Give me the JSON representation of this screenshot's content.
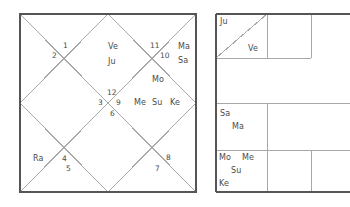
{
  "north_chart": {
    "name": "north-indian-rasi-chart",
    "style": "north-indian-diamond",
    "frame": {
      "x": 20,
      "y": 14,
      "width": 176,
      "height": 178,
      "border_color": "#555555",
      "line_color": "#a8a8a8"
    },
    "houses": [
      {
        "number": "1",
        "x": 63,
        "y": 42,
        "planets": []
      },
      {
        "number": "2",
        "x": 52,
        "y": 52,
        "planets": []
      },
      {
        "number": "3",
        "x": 98,
        "y": 99,
        "planets": []
      },
      {
        "number": "4",
        "x": 62,
        "y": 155,
        "planets": []
      },
      {
        "number": "5",
        "x": 66,
        "y": 165,
        "planets": []
      },
      {
        "number": "6",
        "x": 110,
        "y": 110,
        "planets": []
      },
      {
        "number": "7",
        "x": 155,
        "y": 165,
        "planets": []
      },
      {
        "number": "8",
        "x": 166,
        "y": 154,
        "planets": []
      },
      {
        "number": "9",
        "x": 116,
        "y": 99,
        "planets": []
      },
      {
        "number": "10",
        "x": 160,
        "y": 52,
        "planets": []
      },
      {
        "number": "11",
        "x": 150,
        "y": 42,
        "planets": []
      },
      {
        "number": "12",
        "x": 107,
        "y": 89,
        "planets": []
      }
    ],
    "planet_labels": [
      {
        "text": "Ve",
        "x": 108,
        "y": 43
      },
      {
        "text": "Ju",
        "x": 108,
        "y": 58
      },
      {
        "text": "Ma",
        "x": 178,
        "y": 43
      },
      {
        "text": "Sa",
        "x": 178,
        "y": 57
      },
      {
        "text": "Mo",
        "x": 152,
        "y": 76
      },
      {
        "text": "Me",
        "x": 134,
        "y": 99
      },
      {
        "text": "Su",
        "x": 152,
        "y": 99
      },
      {
        "text": "Ke",
        "x": 170,
        "y": 99
      },
      {
        "text": "Ra",
        "x": 33,
        "y": 155
      }
    ]
  },
  "south_chart": {
    "name": "south-indian-rasi-chart",
    "style": "south-indian-grid",
    "frame": {
      "x": 216,
      "y": 14,
      "width": 138,
      "height": 178,
      "border_color": "#555555",
      "line_color": "#a8a8a8"
    },
    "grid_lines": {
      "vertical_x": [
        267,
        311
      ],
      "horizontal_y": [
        58,
        103,
        150
      ]
    },
    "diagonal_cell": {
      "x1": 216,
      "y1": 58,
      "x2": 267,
      "y2": 14
    },
    "cells": [
      {
        "name": "cell-top-left",
        "labels": [
          {
            "text": "Ju",
            "x": 220,
            "y": 18
          },
          {
            "text": "Ve",
            "x": 248,
            "y": 45
          }
        ]
      },
      {
        "name": "cell-left-upper-mid",
        "labels": []
      },
      {
        "name": "cell-left-lower-mid",
        "labels": [
          {
            "text": "Sa",
            "x": 220,
            "y": 110
          },
          {
            "text": "Ma",
            "x": 232,
            "y": 123
          }
        ]
      },
      {
        "name": "cell-bottom-left",
        "labels": [
          {
            "text": "Mo",
            "x": 219,
            "y": 154
          },
          {
            "text": "Me",
            "x": 242,
            "y": 154
          },
          {
            "text": "Su",
            "x": 231,
            "y": 167
          },
          {
            "text": "Ke",
            "x": 219,
            "y": 180
          }
        ]
      }
    ]
  }
}
